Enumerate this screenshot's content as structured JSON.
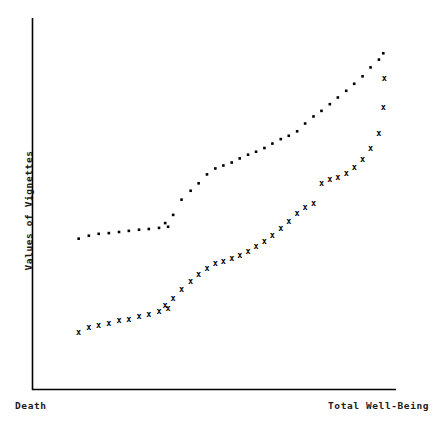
{
  "chart_data": {
    "type": "scatter",
    "title": "",
    "xlabel": "",
    "ylabel": "Values of Vignettes",
    "x_axis_left_label": "Death",
    "x_axis_right_label": "Total Well-Being",
    "xlim": [
      0,
      100
    ],
    "ylim": [
      0,
      100
    ],
    "grid": false,
    "legend": "none",
    "axis_color": "#000000",
    "marker_color": "#000000",
    "series": [
      {
        "name": "dotted-series",
        "marker": "dot",
        "points": [
          [
            12.7,
            40.6
          ],
          [
            15.5,
            41.4
          ],
          [
            18.2,
            41.9
          ],
          [
            21.0,
            42.1
          ],
          [
            23.8,
            42.4
          ],
          [
            26.5,
            42.7
          ],
          [
            29.3,
            43.0
          ],
          [
            32.0,
            43.2
          ],
          [
            34.8,
            43.5
          ],
          [
            37.3,
            43.8
          ],
          [
            36.5,
            44.8
          ],
          [
            38.7,
            47.0
          ],
          [
            41.0,
            51.1
          ],
          [
            43.5,
            53.5
          ],
          [
            45.7,
            55.5
          ],
          [
            48.0,
            57.9
          ],
          [
            50.3,
            59.5
          ],
          [
            52.5,
            60.3
          ],
          [
            54.8,
            61.1
          ],
          [
            57.0,
            62.2
          ],
          [
            59.3,
            63.2
          ],
          [
            61.5,
            64.0
          ],
          [
            63.8,
            65.0
          ],
          [
            66.0,
            66.2
          ],
          [
            68.3,
            67.4
          ],
          [
            70.5,
            68.3
          ],
          [
            72.8,
            69.5
          ],
          [
            75.0,
            71.6
          ],
          [
            77.3,
            73.5
          ],
          [
            79.5,
            75.0
          ],
          [
            81.8,
            76.8
          ],
          [
            84.0,
            78.6
          ],
          [
            86.3,
            80.4
          ],
          [
            88.5,
            82.3
          ],
          [
            90.8,
            84.3
          ],
          [
            93.0,
            86.7
          ],
          [
            95.3,
            88.8
          ],
          [
            96.5,
            90.5
          ]
        ]
      },
      {
        "name": "cross-series",
        "marker": "x",
        "points": [
          [
            12.7,
            15.5
          ],
          [
            15.5,
            16.6
          ],
          [
            18.2,
            17.3
          ],
          [
            21.0,
            17.9
          ],
          [
            23.8,
            18.5
          ],
          [
            26.5,
            19.0
          ],
          [
            29.3,
            19.6
          ],
          [
            32.0,
            20.2
          ],
          [
            34.8,
            20.9
          ],
          [
            37.3,
            21.8
          ],
          [
            36.5,
            22.6
          ],
          [
            38.7,
            24.6
          ],
          [
            41.0,
            27.0
          ],
          [
            43.5,
            29.1
          ],
          [
            45.7,
            31.0
          ],
          [
            48.0,
            32.6
          ],
          [
            50.3,
            33.9
          ],
          [
            52.5,
            34.6
          ],
          [
            54.8,
            35.3
          ],
          [
            57.0,
            36.1
          ],
          [
            59.3,
            37.2
          ],
          [
            61.5,
            38.4
          ],
          [
            63.8,
            40.0
          ],
          [
            66.0,
            41.6
          ],
          [
            68.3,
            43.5
          ],
          [
            70.5,
            45.3
          ],
          [
            72.8,
            47.3
          ],
          [
            75.0,
            49.1
          ],
          [
            77.3,
            50.1
          ],
          [
            79.5,
            55.6
          ],
          [
            81.8,
            56.5
          ],
          [
            84.0,
            57.2
          ],
          [
            86.3,
            58.3
          ],
          [
            88.5,
            59.9
          ],
          [
            90.8,
            62.0
          ],
          [
            93.0,
            65.0
          ],
          [
            95.3,
            69.0
          ],
          [
            96.5,
            76.0
          ],
          [
            96.8,
            83.8
          ]
        ]
      }
    ]
  }
}
